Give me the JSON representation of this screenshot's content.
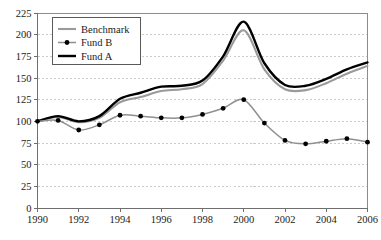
{
  "chart_data": {
    "type": "line",
    "title": "",
    "subtitle": "",
    "xlabel": "",
    "ylabel": "",
    "xlim": [
      1990,
      2006
    ],
    "ylim": [
      0,
      225
    ],
    "grid": true,
    "grid_axis": "y",
    "legend_position": "top-left-inside",
    "y_ticks": [
      0,
      25,
      50,
      75,
      100,
      125,
      150,
      175,
      200,
      225
    ],
    "y_tick_labels": [
      "0",
      "25",
      "50",
      "75",
      "100",
      "125",
      "150",
      "175",
      "200",
      "225"
    ],
    "x_ticks": [
      1990,
      1992,
      1994,
      1996,
      1998,
      2000,
      2002,
      2004,
      2006
    ],
    "x_tick_labels": [
      "1990",
      "1992",
      "1994",
      "1996",
      "1998",
      "2000",
      "2002",
      "2004",
      "2006"
    ],
    "x": [
      1990,
      1991,
      1992,
      1993,
      1994,
      1995,
      1996,
      1997,
      1998,
      1999,
      2000,
      2001,
      2002,
      2003,
      2004,
      2005,
      2006
    ],
    "series": [
      {
        "name": "Benchmark",
        "color": "#9a9a9a",
        "style": "line",
        "markers": false,
        "values": [
          100,
          105,
          99,
          104,
          122,
          128,
          135,
          137,
          143,
          170,
          205,
          160,
          137,
          136,
          144,
          155,
          164
        ]
      },
      {
        "name": "Fund B",
        "color": "#8f8f8f",
        "marker_color": "#000000",
        "style": "line-markers",
        "markers": true,
        "values": [
          100,
          101,
          90,
          96,
          107,
          106,
          104,
          104,
          108,
          115,
          125,
          98,
          78,
          74,
          77,
          80,
          76
        ]
      },
      {
        "name": "Fund A",
        "color": "#000000",
        "style": "line",
        "markers": false,
        "values": [
          100,
          106,
          100,
          106,
          126,
          133,
          140,
          141,
          147,
          175,
          215,
          167,
          142,
          141,
          149,
          160,
          168
        ]
      }
    ]
  },
  "legend": {
    "entries": [
      {
        "label": "Benchmark"
      },
      {
        "label": "Fund B"
      },
      {
        "label": "Fund A"
      }
    ]
  }
}
